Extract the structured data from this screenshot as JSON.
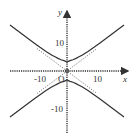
{
  "diagram": {
    "type": "hyperbola-graph",
    "equation_form": "y^2/a^2 - x^2/b^2 = 1",
    "a": 3,
    "b": 4,
    "asymptote_slope": 0.75,
    "axes": {
      "x_label": "x",
      "y_label": "y",
      "origin_label": "O",
      "x_ticks": [
        {
          "value": -10,
          "label": "-10"
        },
        {
          "value": 10,
          "label": "10"
        }
      ],
      "y_ticks": [
        {
          "value": 10,
          "label": "10"
        },
        {
          "value": -10,
          "label": "-10"
        }
      ],
      "x_range": [
        -22,
        22
      ],
      "y_range": [
        -22,
        22
      ]
    },
    "colors": {
      "curve": "#333333",
      "asymptote": "#555555",
      "axis": "#333333",
      "background": "#ffffff"
    }
  }
}
